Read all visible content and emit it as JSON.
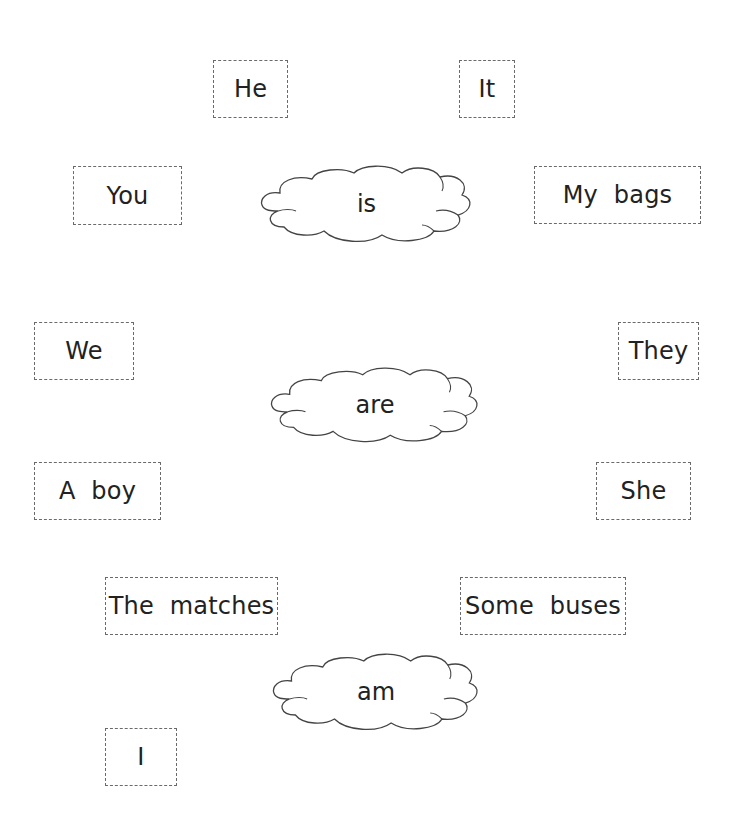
{
  "worksheet": {
    "subject_cards": [
      {
        "id": "he",
        "label": "He"
      },
      {
        "id": "it",
        "label": "It"
      },
      {
        "id": "you",
        "label": "You"
      },
      {
        "id": "my-bags",
        "label": "My bags"
      },
      {
        "id": "we",
        "label": "We"
      },
      {
        "id": "they",
        "label": "They"
      },
      {
        "id": "a-boy",
        "label": "A boy"
      },
      {
        "id": "she",
        "label": "She"
      },
      {
        "id": "the-matches",
        "label": "The matches"
      },
      {
        "id": "some-buses",
        "label": "Some buses"
      },
      {
        "id": "i",
        "label": "I"
      }
    ],
    "verb_clouds": [
      {
        "id": "is",
        "label": "is"
      },
      {
        "id": "are",
        "label": "are"
      },
      {
        "id": "am",
        "label": "am"
      }
    ]
  },
  "colors": {
    "card_border": "#6a6a6a",
    "cloud_stroke": "#444444",
    "text": "#222222",
    "background": "#ffffff"
  }
}
